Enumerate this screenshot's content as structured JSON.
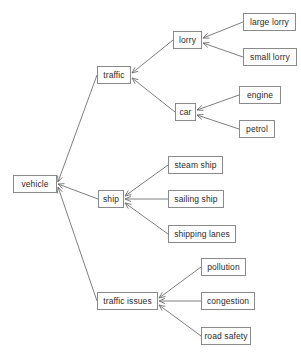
{
  "diagram": {
    "type": "tree",
    "colors": {
      "background": "#ffffff",
      "node_fill": "#ffffff",
      "node_border": "#8a8a8a",
      "edge": "#6f6f6f",
      "text": "#2b2b2b"
    },
    "nodes": [
      {
        "id": "vehicle",
        "label": "vehicle",
        "x": 13,
        "y": 175,
        "w": 44,
        "h": 18
      },
      {
        "id": "traffic",
        "label": "traffic",
        "x": 97,
        "y": 66,
        "w": 34,
        "h": 18
      },
      {
        "id": "ship",
        "label": "ship",
        "x": 98,
        "y": 190,
        "w": 26,
        "h": 18
      },
      {
        "id": "traffic-issues",
        "label": "traffic issues",
        "x": 97,
        "y": 292,
        "w": 61,
        "h": 18
      },
      {
        "id": "lorry",
        "label": "lorry",
        "x": 173,
        "y": 31,
        "w": 29,
        "h": 18
      },
      {
        "id": "car",
        "label": "car",
        "x": 175,
        "y": 103,
        "w": 21,
        "h": 18
      },
      {
        "id": "large-lorry",
        "label": "large lorry",
        "x": 243,
        "y": 13,
        "w": 53,
        "h": 18
      },
      {
        "id": "small-lorry",
        "label": "small lorry",
        "x": 243,
        "y": 48,
        "w": 54,
        "h": 18
      },
      {
        "id": "engine",
        "label": "engine",
        "x": 239,
        "y": 86,
        "w": 42,
        "h": 18
      },
      {
        "id": "petrol",
        "label": "petrol",
        "x": 239,
        "y": 120,
        "w": 36,
        "h": 18
      },
      {
        "id": "steam-ship",
        "label": "steam ship",
        "x": 168,
        "y": 156,
        "w": 55,
        "h": 18
      },
      {
        "id": "sailing-ship",
        "label": "sailing ship",
        "x": 168,
        "y": 190,
        "w": 56,
        "h": 18
      },
      {
        "id": "shipping-lanes",
        "label": "shipping lanes",
        "x": 168,
        "y": 225,
        "w": 68,
        "h": 18
      },
      {
        "id": "pollution",
        "label": "pollution",
        "x": 201,
        "y": 258,
        "w": 45,
        "h": 18
      },
      {
        "id": "congestion",
        "label": "congestion",
        "x": 201,
        "y": 292,
        "w": 54,
        "h": 18
      },
      {
        "id": "road-safety",
        "label": "road safety",
        "x": 201,
        "y": 327,
        "w": 50,
        "h": 18
      }
    ],
    "edges": [
      {
        "from": "traffic",
        "to": "vehicle",
        "x1": 97,
        "y1": 75,
        "x2": 58,
        "y2": 182
      },
      {
        "from": "ship",
        "to": "vehicle",
        "x1": 98,
        "y1": 199,
        "x2": 58,
        "y2": 184
      },
      {
        "from": "traffic-issues",
        "to": "vehicle",
        "x1": 97,
        "y1": 301,
        "x2": 58,
        "y2": 187
      },
      {
        "from": "lorry",
        "to": "traffic",
        "x1": 173,
        "y1": 40,
        "x2": 132,
        "y2": 73
      },
      {
        "from": "car",
        "to": "traffic",
        "x1": 175,
        "y1": 112,
        "x2": 132,
        "y2": 78
      },
      {
        "from": "large-lorry",
        "to": "lorry",
        "x1": 243,
        "y1": 22,
        "x2": 203,
        "y2": 38
      },
      {
        "from": "small-lorry",
        "to": "lorry",
        "x1": 243,
        "y1": 57,
        "x2": 203,
        "y2": 43
      },
      {
        "from": "engine",
        "to": "car",
        "x1": 239,
        "y1": 95,
        "x2": 197,
        "y2": 110
      },
      {
        "from": "petrol",
        "to": "car",
        "x1": 239,
        "y1": 129,
        "x2": 197,
        "y2": 115
      },
      {
        "from": "steam-ship",
        "to": "ship",
        "x1": 168,
        "y1": 165,
        "x2": 125,
        "y2": 196
      },
      {
        "from": "sailing-ship",
        "to": "ship",
        "x1": 168,
        "y1": 199,
        "x2": 125,
        "y2": 199
      },
      {
        "from": "shipping-lanes",
        "to": "ship",
        "x1": 168,
        "y1": 234,
        "x2": 125,
        "y2": 203
      },
      {
        "from": "pollution",
        "to": "traffic-issues",
        "x1": 201,
        "y1": 267,
        "x2": 159,
        "y2": 298
      },
      {
        "from": "congestion",
        "to": "traffic-issues",
        "x1": 201,
        "y1": 301,
        "x2": 159,
        "y2": 301
      },
      {
        "from": "road-safety",
        "to": "traffic-issues",
        "x1": 201,
        "y1": 336,
        "x2": 159,
        "y2": 305
      }
    ]
  }
}
